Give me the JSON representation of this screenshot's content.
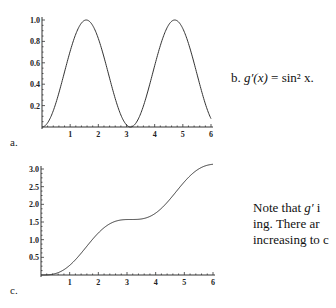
{
  "panels": {
    "a": {
      "label": "a."
    },
    "b": {
      "label": "b.",
      "formula_lhs": "g′(x)",
      "formula_eq": " = ",
      "formula_rhs": "sin² x."
    },
    "c": {
      "label": "c."
    }
  },
  "note": {
    "line1_prefix": "Note that ",
    "line1_math": "g′",
    "line1_suffix": " i",
    "line2": "ing. There ar",
    "line3": "increasing to c"
  },
  "chart_data": [
    {
      "id": "a",
      "type": "line",
      "title": "",
      "function": "sin^2(x)",
      "xlabel": "",
      "ylabel": "",
      "xlim": [
        0,
        6
      ],
      "ylim": [
        0,
        1.0
      ],
      "xticks": [
        1,
        2,
        3,
        4,
        5,
        6
      ],
      "xtick_labels": [
        "1",
        "2",
        "3",
        "4",
        "5",
        "6"
      ],
      "yticks": [
        0.2,
        0.4,
        0.6,
        0.8,
        1.0
      ],
      "ytick_labels": [
        "0.2",
        "0.4",
        "0.6",
        "0.8",
        "1.0"
      ],
      "grid": false,
      "series": [
        {
          "name": "sin^2 x",
          "x": [
            0,
            0.5,
            1.0,
            1.5708,
            2.0,
            2.5,
            3.1416,
            3.5,
            4.0,
            4.7124,
            5.0,
            5.5,
            6.0
          ],
          "y": [
            0,
            0.23,
            0.708,
            1.0,
            0.827,
            0.358,
            0,
            0.123,
            0.573,
            1.0,
            0.919,
            0.499,
            0.078
          ]
        }
      ]
    },
    {
      "id": "c",
      "type": "line",
      "title": "",
      "function": "x/2 - sin(2x)/4",
      "xlabel": "",
      "ylabel": "",
      "xlim": [
        0,
        6
      ],
      "ylim": [
        0,
        3.0
      ],
      "xticks": [
        1,
        2,
        3,
        4,
        5,
        6
      ],
      "xtick_labels": [
        "1",
        "2",
        "3",
        "4",
        "5",
        "6"
      ],
      "yticks": [
        0.5,
        1.0,
        1.5,
        2.0,
        2.5,
        3.0
      ],
      "ytick_labels": [
        "0.5",
        "1.0",
        "1.5",
        "2.0",
        "2.5",
        "3.0"
      ],
      "grid": false,
      "series": [
        {
          "name": "g(x)",
          "x": [
            0,
            0.5,
            1.0,
            1.5708,
            2.0,
            2.5,
            3.1416,
            3.5,
            4.0,
            4.7124,
            5.0,
            5.5,
            6.0
          ],
          "y": [
            0,
            0.04,
            0.273,
            0.785,
            1.189,
            1.486,
            1.571,
            1.583,
            1.753,
            2.356,
            2.636,
            2.75,
            3.134
          ]
        }
      ]
    }
  ]
}
